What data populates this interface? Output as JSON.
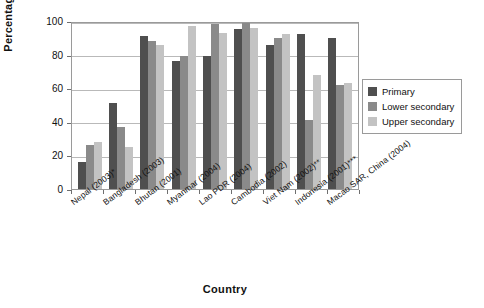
{
  "chart_data": {
    "type": "bar",
    "title": "",
    "subtitle": "",
    "xlabel": "Country",
    "ylabel": "Percentage",
    "ylim": [
      0,
      100
    ],
    "yticks": [
      0,
      20,
      40,
      60,
      80,
      100
    ],
    "grid": true,
    "legend_position": "right",
    "categories": [
      "Nepal (2003)*",
      "Bangladesh (2003)",
      "Bhutan (2001)",
      "Myanmar (2004)",
      "Lao PDR (2004)",
      "Cambodia (2002)",
      "Viet Nam (2002)**",
      "Indonesia (2001)***",
      "Macao SAR, China (2004)"
    ],
    "series": [
      {
        "name": "Primary",
        "color": "#4f4f4f",
        "values": [
          16,
          51,
          91,
          76,
          79,
          95.5,
          86,
          92.5,
          90
        ]
      },
      {
        "name": "Lower secondary",
        "color": "#8a8a8a",
        "values": [
          26,
          37,
          88,
          79,
          98,
          99,
          90,
          41,
          62
        ]
      },
      {
        "name": "Upper secondary",
        "color": "#c3c3c3",
        "values": [
          28,
          25,
          86,
          97,
          93,
          96,
          92,
          68,
          63
        ]
      }
    ]
  },
  "legend": {
    "items": [
      {
        "label": "Primary",
        "color": "#4f4f4f"
      },
      {
        "label": "Lower secondary",
        "color": "#8a8a8a"
      },
      {
        "label": "Upper secondary",
        "color": "#c3c3c3"
      }
    ]
  },
  "axes": {
    "y_title": "Percentage",
    "x_title": "Country",
    "y_ticks": [
      "0",
      "20",
      "40",
      "60",
      "80",
      "100"
    ]
  }
}
